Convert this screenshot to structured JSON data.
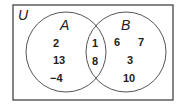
{
  "diagram": {
    "type": "venn",
    "universe_label": "U",
    "sets": [
      {
        "label": "A",
        "only": [
          "2",
          "13",
          "−4"
        ]
      },
      {
        "label": "B",
        "only": [
          "6",
          "7",
          "3",
          "10"
        ]
      }
    ],
    "intersection": [
      "1",
      "8"
    ],
    "colors": {
      "stroke": "#444444",
      "text": "#222222",
      "background": "#ffffff"
    }
  }
}
